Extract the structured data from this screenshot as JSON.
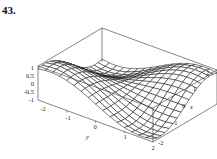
{
  "figure": {
    "number": "43."
  },
  "chart_data": {
    "type": "surface3d",
    "title": "",
    "surface": "z = sin(x) * sin(y) style saddle surface (wireframe mesh)",
    "x_axis": {
      "label": "x",
      "ticks": [
        "-2",
        "-1",
        "0",
        "1",
        "2"
      ],
      "range": [
        -2,
        2
      ]
    },
    "y_axis": {
      "label": "y",
      "ticks": [
        "-2",
        "-1",
        "0",
        "1",
        "2"
      ],
      "range": [
        -2,
        2
      ]
    },
    "z_axis": {
      "label": "",
      "ticks": [
        "1",
        "0.5",
        "0",
        "-0.5",
        "-1"
      ],
      "range": [
        -1,
        1
      ]
    },
    "grid_lines": 16,
    "bounding_box": true,
    "colors": {
      "mesh": "#1a1a1a",
      "box": "#333333",
      "fill": "#ffffff"
    }
  },
  "labels": {
    "z_ticks": [
      "1",
      "0.5",
      "0",
      "-0.5",
      "-1"
    ],
    "y_ticks": [
      "-2",
      "-1",
      "0",
      "1",
      "2"
    ],
    "x_ticks": [
      "2",
      "1",
      "0",
      "-1",
      "-2"
    ],
    "x_label": "x",
    "y_label": "y"
  }
}
